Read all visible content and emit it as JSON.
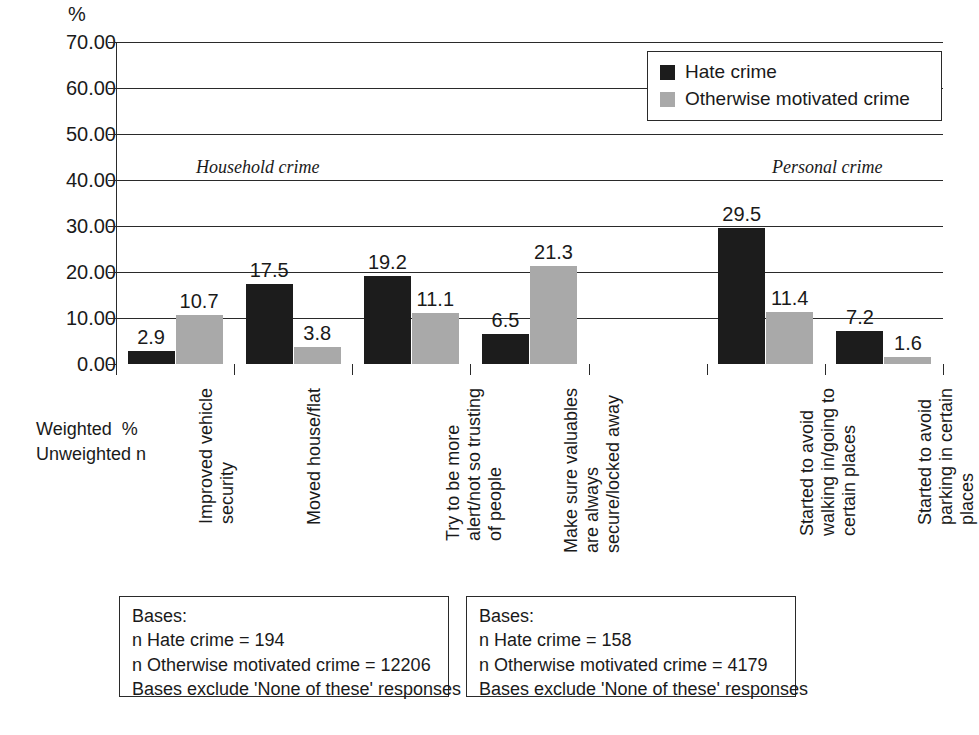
{
  "chart_data": {
    "type": "bar",
    "title": "",
    "ylabel": "%",
    "xlabel": "",
    "ylim": [
      0,
      70
    ],
    "ytick_labels": [
      "0.00",
      "10.00",
      "20.00",
      "30.00",
      "40.00",
      "50.00",
      "60.00",
      "70.00"
    ],
    "ytick_values": [
      0,
      10,
      20,
      30,
      40,
      50,
      60,
      70
    ],
    "grid": true,
    "legend_position": "top-right",
    "categories": [
      "Improved vehicle security",
      "Moved house/flat",
      "Try to be more alert/not so trusting of people",
      "Make sure valuables are always secure/locked away",
      "",
      "Started to avoid walking in/going to certain places",
      "Started to avoid parking in certain places"
    ],
    "series": [
      {
        "name": "Hate crime",
        "color": "#1c1c1c",
        "values": [
          2.9,
          17.5,
          19.2,
          6.5,
          null,
          29.5,
          7.2
        ]
      },
      {
        "name": "Otherwise motivated crime",
        "color": "#a9a9a9",
        "values": [
          10.7,
          3.8,
          11.1,
          21.3,
          null,
          11.4,
          1.6
        ]
      }
    ],
    "annotations": [
      {
        "text": "Household crime",
        "style": "italic"
      },
      {
        "text": "Personal crime",
        "style": "italic"
      }
    ]
  },
  "axis": {
    "unit_label": "%",
    "ticks": [
      {
        "label": "70.00",
        "value": 70
      },
      {
        "label": "60.00",
        "value": 60
      },
      {
        "label": "50.00",
        "value": 50
      },
      {
        "label": "40.00",
        "value": 40
      },
      {
        "label": "30.00",
        "value": 30
      },
      {
        "label": "20.00",
        "value": 20
      },
      {
        "label": "10.00",
        "value": 10
      },
      {
        "label": "0.00",
        "value": 0
      }
    ]
  },
  "legend": {
    "items": [
      {
        "label": "Hate crime",
        "color": "#1c1c1c"
      },
      {
        "label": "Otherwise motivated crime",
        "color": "#a9a9a9"
      }
    ]
  },
  "sections": {
    "household": "Household crime",
    "personal": "Personal crime"
  },
  "weight_caption": {
    "line1": "Weighted  %",
    "line2": "Unweighted n"
  },
  "category_labels": [
    {
      "lines": [
        "Improved vehicle",
        "security"
      ]
    },
    {
      "lines": [
        "Moved house/flat"
      ]
    },
    {
      "lines": [
        "Try to be more",
        "alert/not so trusting",
        "of people"
      ]
    },
    {
      "lines": [
        "Make sure valuables",
        "are always",
        "secure/locked away"
      ]
    },
    {
      "lines": [
        "Started to avoid",
        "walking in/going to",
        "certain places"
      ]
    },
    {
      "lines": [
        "Started to avoid",
        "parking in certain",
        "places"
      ]
    }
  ],
  "bar_values": [
    {
      "label": "2.9"
    },
    {
      "label": "10.7"
    },
    {
      "label": "17.5"
    },
    {
      "label": "3.8"
    },
    {
      "label": "19.2"
    },
    {
      "label": "11.1"
    },
    {
      "label": "6.5"
    },
    {
      "label": "21.3"
    },
    {
      "label": "29.5"
    },
    {
      "label": "11.4"
    },
    {
      "label": "7.2"
    },
    {
      "label": "1.6"
    }
  ],
  "bases_boxes": [
    {
      "lines": [
        "Bases:",
        "n Hate crime = 194",
        "n Otherwise motivated crime = 12206",
        "Bases exclude 'None of these' responses"
      ]
    },
    {
      "lines": [
        "Bases:",
        "n Hate crime = 158",
        "n Otherwise motivated crime = 4179",
        "Bases exclude 'None of these' responses"
      ]
    }
  ]
}
